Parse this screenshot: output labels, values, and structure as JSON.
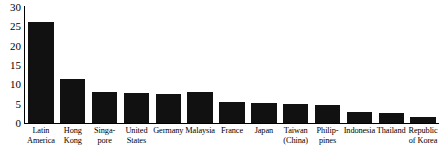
{
  "chart_data": {
    "type": "bar",
    "title": "",
    "subtitle": "",
    "xlabel": "",
    "ylabel": "",
    "ylim": [
      0,
      30
    ],
    "ytick_values": [
      30,
      25,
      20,
      15,
      10,
      5,
      0
    ],
    "ytick_labels": [
      "30",
      "25",
      "20",
      "15",
      "10",
      "5",
      "0"
    ],
    "grid": false,
    "legend": false,
    "legend_position": "none",
    "bar_color": "#111111",
    "categories": [
      "Latin\nAmerica",
      "Hong\nKong",
      "Singa-\npore",
      "United\nStates",
      "Germany",
      "Malaysia",
      "France",
      "Japan",
      "Taiwan\n(China)",
      "Philip-\npines",
      "Indonesia",
      "Thailand",
      "Republic\nof Korea"
    ],
    "values": [
      26.0,
      11.3,
      8.0,
      7.8,
      7.6,
      7.9,
      5.4,
      5.2,
      4.9,
      4.7,
      2.8,
      2.6,
      1.6
    ]
  }
}
